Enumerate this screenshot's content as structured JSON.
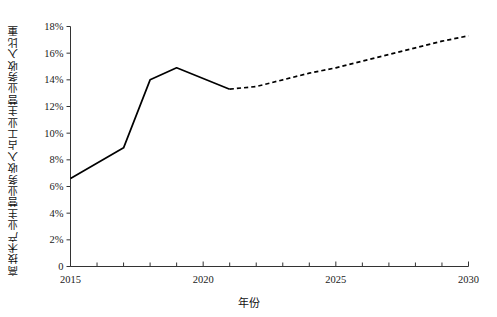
{
  "chart_data": {
    "type": "line",
    "title": "",
    "xlabel": "年份",
    "ylabel": "高技术产业主营业务收入占工业主营业务收入比重",
    "xlim": [
      2015,
      2030
    ],
    "ylim": [
      0,
      18
    ],
    "ytick_labels": [
      "0",
      "2%",
      "4%",
      "6%",
      "8%",
      "10%",
      "12%",
      "14%",
      "16%",
      "18%"
    ],
    "ytick_values": [
      0,
      2,
      4,
      6,
      8,
      10,
      12,
      14,
      16,
      18
    ],
    "xtick_labels": [
      "2015",
      "2020",
      "2025",
      "2030"
    ],
    "xtick_values": [
      2015,
      2020,
      2025,
      2030
    ],
    "xminor_values": [
      2016,
      2017,
      2018,
      2019,
      2021,
      2022,
      2023,
      2024,
      2026,
      2027,
      2028,
      2029
    ],
    "grid": false,
    "legend": "none",
    "series": [
      {
        "name": "历史值",
        "style": "solid",
        "color": "#000000",
        "x": [
          2015,
          2017,
          2018,
          2019,
          2021
        ],
        "values": [
          6.6,
          8.9,
          14.0,
          14.9,
          13.3
        ]
      },
      {
        "name": "预测值",
        "style": "dashed",
        "color": "#000000",
        "x": [
          2021,
          2022,
          2023,
          2024,
          2025,
          2026,
          2027,
          2028,
          2029,
          2030
        ],
        "values": [
          13.3,
          13.5,
          14.0,
          14.5,
          14.9,
          15.4,
          15.9,
          16.4,
          16.9,
          17.3
        ]
      }
    ]
  },
  "axes": {
    "ylabel_text": "高技术产业主营业务收入占工业主营业务收入比重",
    "xlabel_text": "年份"
  }
}
